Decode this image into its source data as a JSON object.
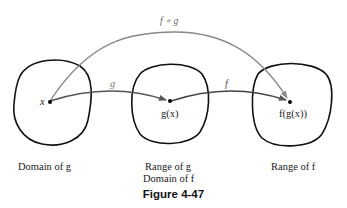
{
  "figure": {
    "caption": "Figure 4-47",
    "composition_label": "f ∘ g",
    "g_label": "g",
    "f_label": "f"
  },
  "points": {
    "x": "x",
    "gx": "g(x)",
    "fgx": "f(g(x))"
  },
  "sets": {
    "domain_g": "Domain of g",
    "range_g": "Range of g",
    "domain_f": "Domain of f",
    "range_f": "Range of f"
  },
  "colors": {
    "blob": "#111111",
    "arrow_g_f": "#333333",
    "arrow_composite": "#777777"
  }
}
